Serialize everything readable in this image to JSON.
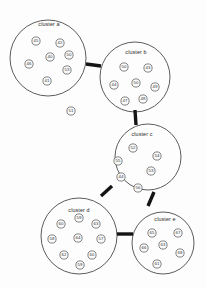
{
  "diagram": {
    "type": "node-link-cluster-graph",
    "title": "",
    "canvas": {
      "width": 207,
      "height": 288,
      "background": "#fdfdfd"
    },
    "style": {
      "node_radius": 4.1,
      "node_fill": "#fbfbfb",
      "node_stroke": "#5a5a5a",
      "cluster_stroke": "#4a4a4a",
      "edge_color": "#141414",
      "edge_width": 3.4,
      "label_color": "#2b2b2b"
    },
    "clusters": [
      {
        "id": "a",
        "label": "cluster a",
        "cx": 48,
        "cy": 58,
        "r": 38,
        "label_x": 49,
        "label_y": 26,
        "nodes": [
          {
            "id": "45",
            "label": "45",
            "x": 36,
            "y": 41
          },
          {
            "id": "42",
            "label": "42",
            "x": 60,
            "y": 43
          },
          {
            "id": "40",
            "label": "40",
            "x": 50,
            "y": 57
          },
          {
            "id": "50",
            "label": "50",
            "x": 69,
            "y": 55
          },
          {
            "id": "46",
            "label": "46",
            "x": 29,
            "y": 64
          },
          {
            "id": "53",
            "label": "53",
            "x": 67,
            "y": 70
          },
          {
            "id": "41",
            "label": "41",
            "x": 47,
            "y": 81
          }
        ]
      },
      {
        "id": "b",
        "label": "cluster b",
        "cx": 135,
        "cy": 77,
        "r": 35,
        "label_x": 136,
        "label_y": 54,
        "nodes": [
          {
            "id": "50b",
            "label": "50",
            "x": 124,
            "y": 67
          },
          {
            "id": "43",
            "label": "43",
            "x": 148,
            "y": 68
          },
          {
            "id": "44",
            "label": "44",
            "x": 114,
            "y": 85
          },
          {
            "id": "50c",
            "label": "50",
            "x": 136,
            "y": 83
          },
          {
            "id": "49",
            "label": "49",
            "x": 155,
            "y": 87
          },
          {
            "id": "47",
            "label": "47",
            "x": 125,
            "y": 101
          },
          {
            "id": "48",
            "label": "48",
            "x": 143,
            "y": 99
          }
        ]
      },
      {
        "id": "c",
        "label": "cluster c",
        "cx": 148,
        "cy": 157,
        "r": 33,
        "label_x": 142,
        "label_y": 136,
        "nodes": [
          {
            "id": "52",
            "label": "52",
            "x": 133,
            "y": 148
          },
          {
            "id": "54",
            "label": "54",
            "x": 157,
            "y": 156
          },
          {
            "id": "55",
            "label": "55",
            "x": 118,
            "y": 161
          },
          {
            "id": "53c",
            "label": "53",
            "x": 151,
            "y": 171
          },
          {
            "id": "44c",
            "label": "44",
            "x": 121,
            "y": 177
          },
          {
            "id": "56",
            "label": "56",
            "x": 138,
            "y": 188
          }
        ]
      },
      {
        "id": "d",
        "label": "cluster d",
        "cx": 79,
        "cy": 236,
        "r": 38,
        "label_x": 79,
        "label_y": 212,
        "nodes": [
          {
            "id": "59",
            "label": "59",
            "x": 79,
            "y": 218
          },
          {
            "id": "60",
            "label": "60",
            "x": 61,
            "y": 224
          },
          {
            "id": "63",
            "label": "63",
            "x": 96,
            "y": 224
          },
          {
            "id": "58",
            "label": "58",
            "x": 52,
            "y": 239
          },
          {
            "id": "64",
            "label": "64",
            "x": 78,
            "y": 238
          },
          {
            "id": "57",
            "label": "57",
            "x": 101,
            "y": 239
          },
          {
            "id": "62",
            "label": "62",
            "x": 64,
            "y": 255
          },
          {
            "id": "60d",
            "label": "60",
            "x": 92,
            "y": 255
          },
          {
            "id": "59d",
            "label": "59",
            "x": 80,
            "y": 265
          }
        ]
      },
      {
        "id": "e",
        "label": "cluster e",
        "cx": 163,
        "cy": 243,
        "r": 31,
        "label_x": 165,
        "label_y": 221,
        "nodes": [
          {
            "id": "65",
            "label": "65",
            "x": 152,
            "y": 233
          },
          {
            "id": "67",
            "label": "67",
            "x": 178,
            "y": 233
          },
          {
            "id": "66",
            "label": "66",
            "x": 144,
            "y": 248
          },
          {
            "id": "63e",
            "label": "63",
            "x": 163,
            "y": 245
          },
          {
            "id": "68",
            "label": "68",
            "x": 180,
            "y": 253
          },
          {
            "id": "61",
            "label": "61",
            "x": 157,
            "y": 264
          }
        ]
      }
    ],
    "isolated_nodes": [
      {
        "id": "51",
        "label": "51",
        "x": 71,
        "y": 111
      }
    ],
    "edges": [
      {
        "source": "a",
        "target": "b",
        "x1": 86,
        "y1": 64,
        "x2": 101,
        "y2": 66
      },
      {
        "source": "b",
        "target": "c",
        "x1": 135,
        "y1": 110,
        "x2": 136,
        "y2": 125
      },
      {
        "source": "c",
        "target": "d",
        "x1": 112,
        "y1": 186,
        "x2": 101,
        "y2": 196
      },
      {
        "source": "c",
        "target": "e",
        "x1": 154,
        "y1": 192,
        "x2": 148,
        "y2": 206
      },
      {
        "source": "d",
        "target": "e",
        "x1": 117,
        "y1": 234,
        "x2": 133,
        "y2": 234
      }
    ]
  }
}
